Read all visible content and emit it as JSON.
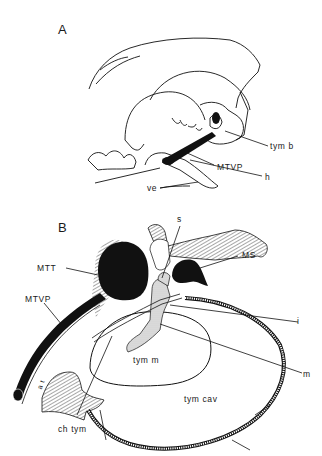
{
  "figure": {
    "panels": [
      {
        "id": "A",
        "label": "A",
        "annotations": {
          "tym_b": "tym b",
          "mtvp": "MTVP",
          "h": "h",
          "ve": "ve"
        }
      },
      {
        "id": "B",
        "label": "B",
        "annotations": {
          "s": "s",
          "ms": "MS",
          "mtt": "MTT",
          "mtvp": "MTVP",
          "i": "i",
          "tym_m": "tym m",
          "m": "m",
          "at": "a t",
          "tym_cav": "tym cav",
          "ch_tym": "ch tym"
        }
      }
    ],
    "colors": {
      "ink": "#111111",
      "background": "#ffffff",
      "stipple": "#cfcfcf"
    }
  }
}
